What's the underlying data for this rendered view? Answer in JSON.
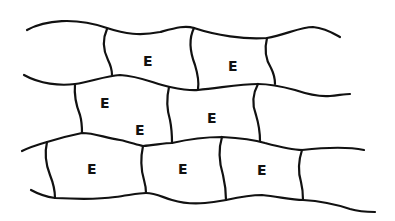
{
  "diagram": {
    "type": "cell-layer-schematic",
    "stroke_color": "#111111",
    "background": "#ffffff",
    "rows": 3,
    "cells": [
      {
        "id": "r1c1",
        "row": 1,
        "label": "E",
        "x": 148,
        "y": 61
      },
      {
        "id": "r1c2",
        "row": 1,
        "label": "E",
        "x": 233,
        "y": 66
      },
      {
        "id": "r2c1",
        "row": 2,
        "label": "E",
        "x": 105,
        "y": 103
      },
      {
        "id": "r2c2",
        "row": 2,
        "label": "E",
        "x": 140,
        "y": 130
      },
      {
        "id": "r2c3",
        "row": 2,
        "label": "E",
        "x": 212,
        "y": 118
      },
      {
        "id": "r3c1",
        "row": 3,
        "label": "E",
        "x": 92,
        "y": 169
      },
      {
        "id": "r3c2",
        "row": 3,
        "label": "E",
        "x": 183,
        "y": 169
      },
      {
        "id": "r3c3",
        "row": 3,
        "label": "E",
        "x": 262,
        "y": 170
      }
    ]
  }
}
